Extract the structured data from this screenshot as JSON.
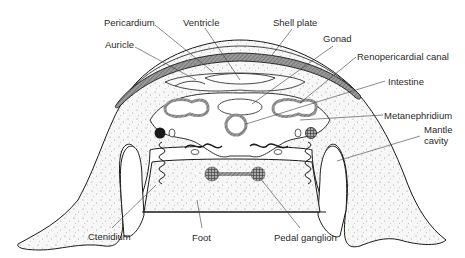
{
  "figure": {
    "type": "anatomical cross-section diagram",
    "colors": {
      "line": "#1a1a1a",
      "shell_fill": "#8a8a8a",
      "tissue_fill": "#f4f4f4",
      "stipple": "#9a9a9a",
      "background": "#ffffff"
    }
  },
  "labels": {
    "pericardium": "Pericardium",
    "ventricle": "Ventricle",
    "shell_plate": "Shell plate",
    "auricle": "Auricle",
    "gonad": "Gonad",
    "renopericardial_canal": "Renopericardial canal",
    "intestine": "Intestine",
    "metanephridium": "Metanephridium",
    "mantle_cavity_line1": "Mantle",
    "mantle_cavity_line2": "cavity",
    "ctenidium": "Ctenidium",
    "foot": "Foot",
    "pedal_ganglion": "Pedal ganglion"
  }
}
